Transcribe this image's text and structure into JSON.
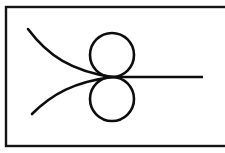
{
  "figure": {
    "background_color": "#ffffff",
    "ink_color": "#0d0d0d"
  },
  "frame": {
    "name": "border-rectangle",
    "x": 6,
    "y": 7,
    "width": 224,
    "height": 139,
    "stroke_width": 2.4,
    "color": "#141414"
  },
  "node": {
    "label": "tangency-node",
    "x": 112,
    "y": 77
  },
  "circles": [
    {
      "label": "upper-circle",
      "cx": 112,
      "cy": 55,
      "r": 22,
      "stroke_width": 2.6,
      "color": "#0d0d0d"
    },
    {
      "label": "lower-circle",
      "cx": 112,
      "cy": 99,
      "r": 22,
      "stroke_width": 2.6,
      "color": "#0d0d0d"
    }
  ],
  "ray": {
    "label": "horizontal-ray",
    "x1": 112,
    "y1": 77,
    "x2": 203,
    "y2": 77,
    "stroke_width": 2.6,
    "color": "#0d0d0d"
  },
  "curves": [
    {
      "label": "upper-left-curve",
      "path": "M 28 29 C 48 56 72 71 112 77",
      "start": [
        28,
        29
      ],
      "end": [
        112,
        77
      ],
      "stroke_width": 2.6,
      "color": "#0d0d0d"
    },
    {
      "label": "lower-left-curve",
      "path": "M 32 114 C 52 94 74 82 112 77",
      "start": [
        32,
        114
      ],
      "end": [
        112,
        77
      ],
      "stroke_width": 2.6,
      "color": "#0d0d0d"
    }
  ],
  "chart_data": {
    "type": "scatter",
    "xlabel": "",
    "ylabel": "",
    "xlim": [
      6,
      230
    ],
    "ylim": [
      7,
      146
    ],
    "grid": false,
    "legend": "none",
    "series": [
      {
        "name": "upper-circle",
        "kind": "circle",
        "center": [
          112,
          55
        ],
        "radius": 22
      },
      {
        "name": "lower-circle",
        "kind": "circle",
        "center": [
          112,
          99
        ],
        "radius": 22
      },
      {
        "name": "horizontal-ray",
        "kind": "line",
        "points": [
          [
            112,
            77
          ],
          [
            203,
            77
          ]
        ]
      },
      {
        "name": "upper-left-curve",
        "kind": "curve",
        "points": [
          [
            28,
            29
          ],
          [
            48,
            56
          ],
          [
            72,
            71
          ],
          [
            112,
            77
          ]
        ]
      },
      {
        "name": "lower-left-curve",
        "kind": "curve",
        "points": [
          [
            32,
            114
          ],
          [
            52,
            94
          ],
          [
            74,
            82
          ],
          [
            112,
            77
          ]
        ]
      }
    ],
    "annotations": [
      {
        "name": "tangency-node",
        "x": 112,
        "y": 77,
        "text": ""
      }
    ]
  }
}
